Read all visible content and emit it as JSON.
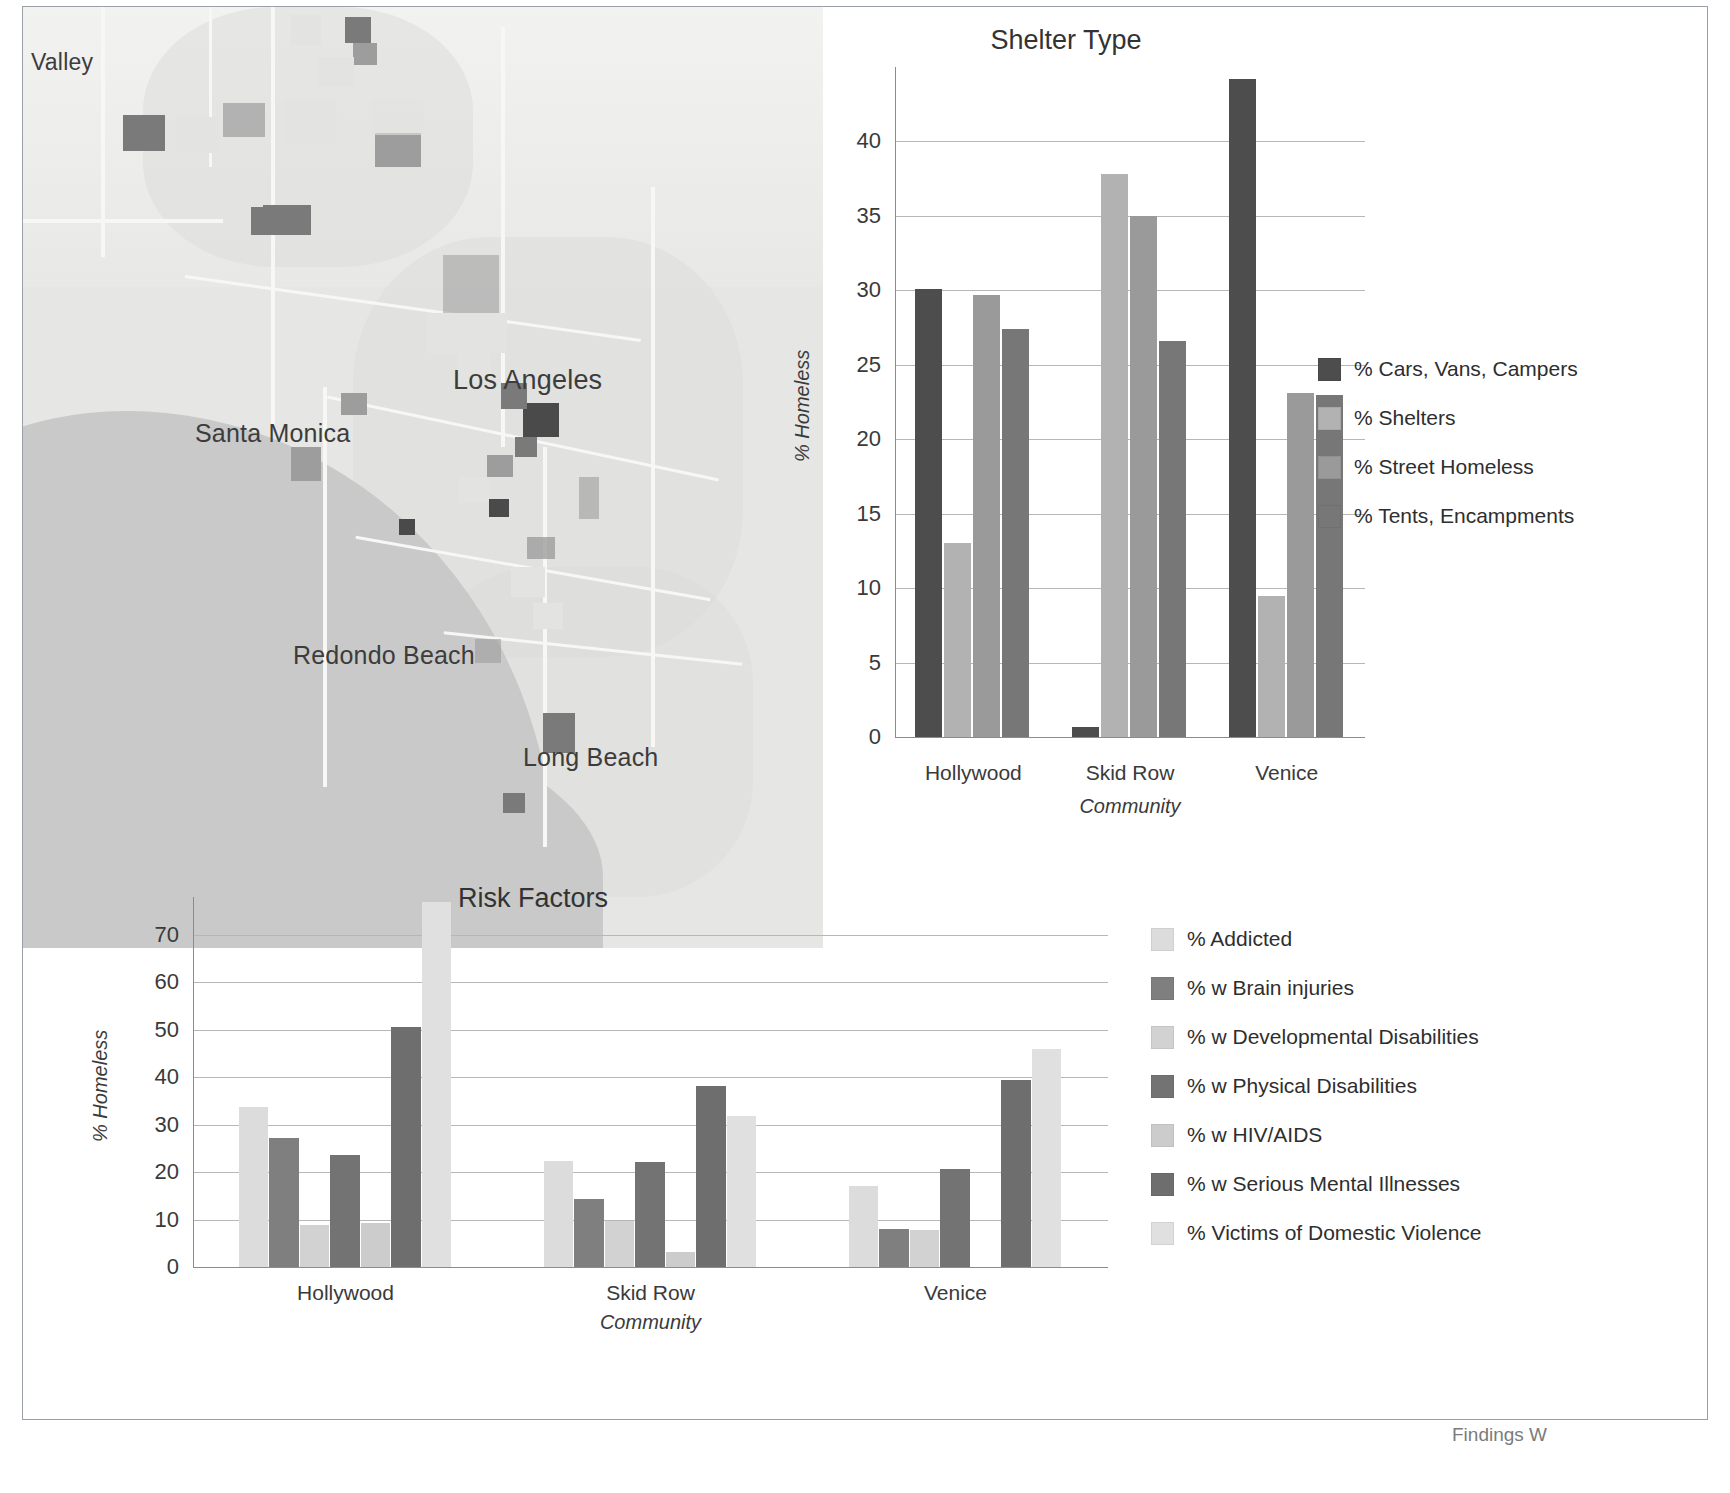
{
  "map": {
    "name": "los-angeles-homeless-density-map",
    "labels": [
      {
        "text": "Valley",
        "x": 8,
        "y": 55,
        "size": 23
      },
      {
        "text": "Los Angeles",
        "x": 430,
        "y": 372,
        "size": 27
      },
      {
        "text": "Santa Monica",
        "x": 172,
        "y": 424,
        "size": 25
      },
      {
        "text": "Redondo Beach",
        "x": 270,
        "y": 646,
        "size": 25
      },
      {
        "text": "Long Beach",
        "x": 500,
        "y": 748,
        "size": 25
      }
    ]
  },
  "shelter_chart": {
    "title": "Shelter Type",
    "legend_position": "right"
  },
  "risk_chart": {
    "title": "Risk Factors",
    "legend_position": "right"
  },
  "footer": {
    "partial_text": "Findings W"
  },
  "chart_data": [
    {
      "id": "shelter-type",
      "type": "bar",
      "title": "Shelter Type",
      "xlabel": "Community",
      "ylabel": "% Homeless",
      "ylim": [
        0,
        45
      ],
      "yticks": [
        0,
        5,
        10,
        15,
        20,
        25,
        30,
        35,
        40
      ],
      "grid": true,
      "legend": "right",
      "categories": [
        "Hollywood",
        "Skid Row",
        "Venice"
      ],
      "series": [
        {
          "name": "% Cars, Vans, Campers",
          "color": "#4d4d4d",
          "values": [
            30.1,
            0.7,
            44.2
          ]
        },
        {
          "name": "% Shelters",
          "color": "#b2b2b2",
          "values": [
            13.0,
            37.8,
            9.5
          ]
        },
        {
          "name": "% Street Homeless",
          "color": "#9a9a9a",
          "values": [
            29.7,
            35.0,
            23.1
          ]
        },
        {
          "name": "% Tents, Encampments",
          "color": "#777777",
          "values": [
            27.4,
            26.6,
            23.0
          ]
        }
      ]
    },
    {
      "id": "risk-factors",
      "type": "bar",
      "title": "Risk Factors",
      "xlabel": "Community",
      "ylabel": "% Homeless",
      "ylim": [
        0,
        78
      ],
      "yticks": [
        0,
        10,
        20,
        30,
        40,
        50,
        60,
        70
      ],
      "grid": true,
      "legend": "right",
      "categories": [
        "Hollywood",
        "Skid Row",
        "Venice"
      ],
      "series": [
        {
          "name": "% Addicted",
          "color": "#dcdcdc",
          "values": [
            33.8,
            22.4,
            17.1
          ]
        },
        {
          "name": "% w Brain injuries",
          "color": "#7f7f7f",
          "values": [
            27.3,
            14.4,
            8.1
          ]
        },
        {
          "name": "% w Developmental Disabilities",
          "color": "#d2d2d2",
          "values": [
            8.8,
            9.7,
            7.7
          ]
        },
        {
          "name": "% w Physical Disabilities",
          "color": "#737373",
          "values": [
            23.7,
            22.1,
            20.6
          ]
        },
        {
          "name": "% w HIV/AIDS",
          "color": "#cccccc",
          "values": [
            9.2,
            3.1,
            0.0
          ]
        },
        {
          "name": "% w Serious Mental Illnesses",
          "color": "#6e6e6e",
          "values": [
            50.5,
            38.2,
            39.5
          ]
        },
        {
          "name": "% Victims of Domestic Violence",
          "color": "#e0e0e0",
          "values": [
            77.0,
            31.8,
            46.0
          ]
        }
      ]
    }
  ]
}
